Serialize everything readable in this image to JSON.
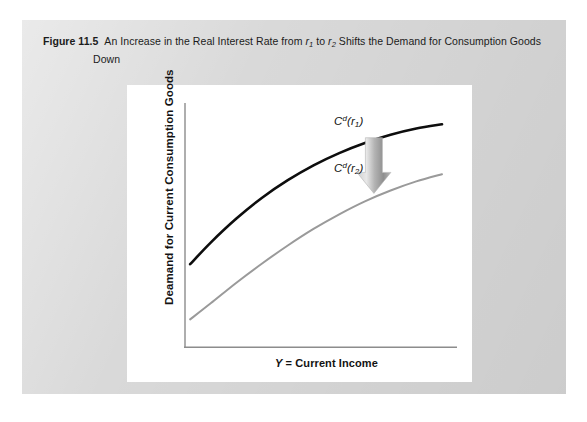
{
  "figure": {
    "number_label": "Figure 11.5",
    "caption_line1_a": "An Increase in the Real Interest Rate from ",
    "caption_r1": "r",
    "caption_r1_sub": "1",
    "caption_line1_b": " to ",
    "caption_r2": "r",
    "caption_r2_sub": "2",
    "caption_line1_c": " Shifts the Demand for Consumption Goods",
    "caption_line2": "Down"
  },
  "chart_data": {
    "type": "line",
    "title": "An Increase in the Real Interest Rate from r1 to r2 Shifts the Demand for Consumption Goods Down",
    "xlabel": "Y = Current Income",
    "ylabel": "Deamand for Current Consumption Goods",
    "xlabel_parts": {
      "symbol": "Y",
      "rest": " = Current Income"
    },
    "grid": false,
    "legend_position": "right-inline",
    "axis_color": "#8c8c8c",
    "series": [
      {
        "name": "Cd(r1)",
        "label_base": "C",
        "label_sup": "d",
        "label_open": "(",
        "label_var": "r",
        "label_sub": "1",
        "label_close": ")",
        "color": "#0d0d0d",
        "width": 2.6,
        "points": [
          [
            0.02,
            0.345
          ],
          [
            0.1,
            0.435
          ],
          [
            0.2,
            0.535
          ],
          [
            0.3,
            0.622
          ],
          [
            0.4,
            0.695
          ],
          [
            0.5,
            0.757
          ],
          [
            0.6,
            0.808
          ],
          [
            0.7,
            0.85
          ],
          [
            0.8,
            0.884
          ],
          [
            0.9,
            0.91
          ],
          [
            1.0,
            0.928
          ]
        ]
      },
      {
        "name": "Cd(r2)",
        "label_base": "C",
        "label_sup": "d",
        "label_open": "(",
        "label_var": "r",
        "label_sub": "2",
        "label_close": ")",
        "color": "#9a9a9a",
        "width": 2.0,
        "points": [
          [
            0.02,
            0.115
          ],
          [
            0.1,
            0.182
          ],
          [
            0.2,
            0.268
          ],
          [
            0.3,
            0.348
          ],
          [
            0.4,
            0.423
          ],
          [
            0.5,
            0.492
          ],
          [
            0.6,
            0.553
          ],
          [
            0.7,
            0.607
          ],
          [
            0.8,
            0.652
          ],
          [
            0.9,
            0.69
          ],
          [
            1.0,
            0.72
          ]
        ]
      }
    ],
    "annotations": [
      {
        "name": "shift-down-arrow",
        "type": "block-arrow",
        "direction": "down",
        "x": 0.735,
        "y_from": 0.872,
        "y_to": 0.64,
        "color": "#a8a8a8"
      }
    ]
  }
}
